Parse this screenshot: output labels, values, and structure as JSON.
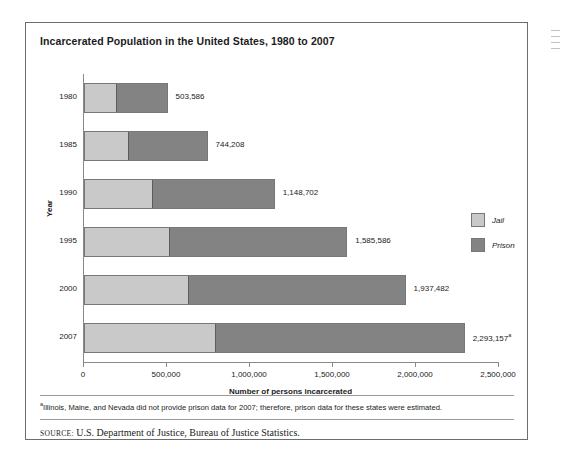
{
  "chart_data": {
    "type": "bar",
    "orientation": "horizontal",
    "stacked": true,
    "title": "Incarcerated Population in the United States, 1980 to 2007",
    "xlabel": "Number of persons incarcerated",
    "ylabel": "Year",
    "categories": [
      "1980",
      "1985",
      "1990",
      "1995",
      "2000",
      "2007"
    ],
    "series": [
      {
        "name": "Jail",
        "values": [
          183988,
          256615,
          405320,
          507044,
          621149,
          780581
        ]
      },
      {
        "name": "Prison",
        "values": [
          319598,
          487593,
          743382,
          1078542,
          1316333,
          1512576
        ]
      }
    ],
    "totals": [
      503586,
      744208,
      1148702,
      1585586,
      1937482,
      2293157
    ],
    "total_labels": [
      "503,586",
      "744,208",
      "1,148,702",
      "1,585,586",
      "1,937,482",
      "2,293,157"
    ],
    "xlim": [
      0,
      2500000
    ],
    "xticks": [
      0,
      500000,
      1000000,
      1500000,
      2000000,
      2500000
    ],
    "xtick_labels": [
      "0",
      "500,000",
      "1,000,000",
      "1,500,000",
      "2,000,000",
      "2,500,000"
    ],
    "grid": false,
    "legend_position": "right",
    "colors": {
      "jail": "#c9c9c9",
      "prison": "#838383",
      "frame": "#6d6d6d",
      "text": "#1b1b1b"
    },
    "footnote_marker": "a",
    "footnote_marker_on": "2007"
  },
  "legend": {
    "items": [
      {
        "label": "Jail",
        "color": "#c9c9c9"
      },
      {
        "label": "Prison",
        "color": "#838383"
      }
    ]
  },
  "notes": {
    "footnote_marker": "a",
    "footnote_text": "Illinois, Maine, and Nevada did not provide prison data for 2007; therefore, prison data for these states were estimated.",
    "source_label": "SOURCE:",
    "source_text": "U.S. Department of Justice, Bureau of Justice Statistics."
  }
}
